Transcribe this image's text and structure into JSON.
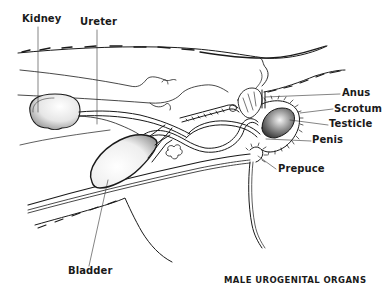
{
  "diagram": {
    "title": "MALE UROGENITAL ORGANS",
    "labels": {
      "kidney": "Kidney",
      "ureter": "Ureter",
      "anus": "Anus",
      "scrotum": "Scrotum",
      "testicle": "Testicle",
      "penis": "Penis",
      "prepuce": "Prepuce",
      "bladder": "Bladder"
    },
    "colors": {
      "ink": "#1a1a1a",
      "background": "#ffffff"
    }
  }
}
